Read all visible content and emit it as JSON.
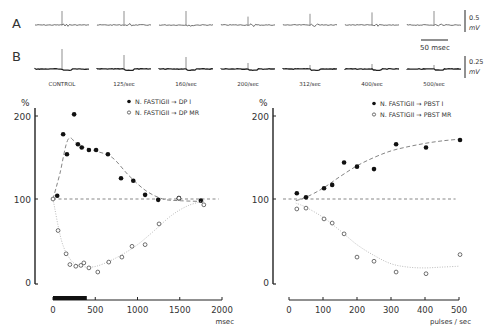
{
  "traces": {
    "row_labels": [
      "A",
      "B"
    ],
    "columns": [
      "CONTROL",
      "125/sec",
      "160/sec",
      "200/sec",
      "312/sec",
      "400/sec",
      "500/sec"
    ],
    "a_spike_amplitude": [
      1.0,
      1.0,
      1.0,
      0.6,
      0.8,
      0.9,
      1.0
    ],
    "b_spike_amplitude": [
      1.0,
      0.7,
      0.6,
      0.3,
      0.2,
      0.25,
      0.2
    ],
    "scale_a_value": "0.5",
    "scale_a_unit": "mV",
    "scale_b_value": "0.25",
    "scale_b_unit": "mV",
    "time_scale_label": "50 msec"
  },
  "chart_data": [
    {
      "type": "scatter",
      "title": "",
      "ylabel": "%",
      "xlabel": "msec",
      "xlim": [
        0,
        2000
      ],
      "ylim": [
        0,
        200
      ],
      "xticks": [
        0,
        500,
        1000,
        1500,
        2000
      ],
      "xtick_labels": [
        "0",
        "500",
        "1000",
        "1500",
        "2000"
      ],
      "yticks": [
        0,
        100,
        200
      ],
      "ytick_labels": [
        "0",
        "100",
        "200"
      ],
      "stimulus_bar": [
        0,
        400
      ],
      "reference_line": 100,
      "legend_position": "top-right",
      "series": [
        {
          "name": "N. FASTIGII → DP I",
          "marker": "filled",
          "x": [
            50,
            120,
            165,
            250,
            295,
            340,
            425,
            510,
            650,
            805,
            950,
            1090,
            1245,
            1490,
            1750
          ],
          "y": [
            104,
            178,
            154,
            202,
            166,
            162,
            159,
            159,
            154,
            125,
            122,
            105,
            99,
            101,
            98
          ],
          "curve_x": [
            0,
            80,
            180,
            300,
            500,
            700,
            900,
            1100,
            1300,
            1500,
            1800
          ],
          "curve_y": [
            100,
            130,
            172,
            165,
            158,
            150,
            128,
            110,
            100,
            98,
            97
          ]
        },
        {
          "name": "N. FASTIGII → DP MR",
          "marker": "open",
          "x": [
            0,
            60,
            155,
            200,
            270,
            330,
            365,
            425,
            530,
            660,
            815,
            935,
            1090,
            1255,
            1490,
            1785
          ],
          "y": [
            100,
            62,
            34,
            21,
            19,
            20,
            23,
            17,
            12,
            24,
            30,
            43,
            45,
            70,
            101,
            93
          ],
          "curve_x": [
            0,
            100,
            200,
            300,
            450,
            600,
            800,
            1000,
            1200,
            1400,
            1600,
            1800
          ],
          "curve_y": [
            100,
            50,
            28,
            20,
            18,
            22,
            32,
            45,
            62,
            80,
            92,
            98
          ]
        }
      ]
    },
    {
      "type": "scatter",
      "title": "",
      "ylabel": "%",
      "xlabel": "pulses / sec",
      "xlim": [
        0,
        500
      ],
      "ylim": [
        0,
        200
      ],
      "xticks": [
        0,
        100,
        200,
        300,
        400,
        500
      ],
      "xtick_labels": [
        "0",
        "100",
        "200",
        "300",
        "400",
        "500"
      ],
      "yticks": [
        0,
        100,
        200
      ],
      "ytick_labels": [
        "0",
        "100",
        "200"
      ],
      "reference_line": 100,
      "legend_position": "top-right",
      "series": [
        {
          "name": "N. FASTIGII → PBST I",
          "marker": "filled",
          "x": [
            23,
            50,
            103,
            127,
            162,
            200,
            250,
            315,
            403,
            503
          ],
          "y": [
            107,
            102,
            113,
            117,
            144,
            139,
            136,
            166,
            162,
            171
          ],
          "curve_x": [
            20,
            50,
            100,
            150,
            200,
            250,
            300,
            350,
            400,
            450,
            500
          ],
          "curve_y": [
            98,
            102,
            113,
            127,
            140,
            150,
            158,
            163,
            167,
            170,
            172
          ]
        },
        {
          "name": "N. FASTIGII → PBST MR",
          "marker": "open",
          "x": [
            23,
            50,
            103,
            127,
            162,
            200,
            250,
            315,
            403,
            503
          ],
          "y": [
            88,
            89,
            76,
            71,
            58,
            30,
            25,
            12,
            10,
            33
          ],
          "curve_x": [
            20,
            50,
            100,
            150,
            200,
            250,
            300,
            350,
            400,
            450,
            500
          ],
          "curve_y": [
            95,
            90,
            78,
            62,
            45,
            32,
            22,
            18,
            17,
            18,
            19
          ]
        }
      ]
    }
  ]
}
